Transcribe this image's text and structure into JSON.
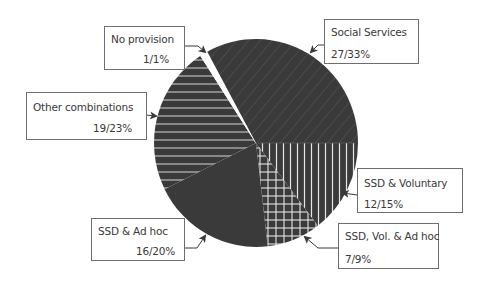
{
  "chart_data": {
    "type": "pie",
    "title": "",
    "slices": [
      {
        "label": "Social Services",
        "count": 27,
        "percent": 33,
        "value_text": "27/33%",
        "pattern": "diagonal"
      },
      {
        "label": "SSD & Voluntary",
        "count": 12,
        "percent": 15,
        "value_text": "12/15%",
        "pattern": "vertical"
      },
      {
        "label": "SSD, Vol. & Ad hoc",
        "count": 7,
        "percent": 9,
        "value_text": "7/9%",
        "pattern": "grid"
      },
      {
        "label": "SSD & Ad hoc",
        "count": 16,
        "percent": 20,
        "value_text": "16/20%",
        "pattern": "solid"
      },
      {
        "label": "Other combinations",
        "count": 19,
        "percent": 23,
        "value_text": "19/23%",
        "pattern": "horizontal"
      },
      {
        "label": "No provision",
        "count": 1,
        "percent": 1,
        "value_text": "1/1%",
        "pattern": "white"
      }
    ],
    "legend": "callout labels with arrows",
    "colors": {
      "fill": "#3a3a3a",
      "pattern_line": "#e8e8e8",
      "border": "#6e6e6e",
      "text": "#3a3a3a"
    }
  },
  "labels": {
    "social_services": {
      "name": "Social Services",
      "value": "27/33%"
    },
    "ssd_voluntary": {
      "name": "SSD & Voluntary",
      "value": "12/15%"
    },
    "ssd_vol_adhoc": {
      "name": "SSD, Vol. & Ad hoc",
      "value": "7/9%"
    },
    "ssd_adhoc": {
      "name": "SSD & Ad hoc",
      "value": "16/20%"
    },
    "other": {
      "name": "Other combinations",
      "value": "19/23%"
    },
    "no_provision": {
      "name": "No provision",
      "value": "1/1%"
    }
  }
}
